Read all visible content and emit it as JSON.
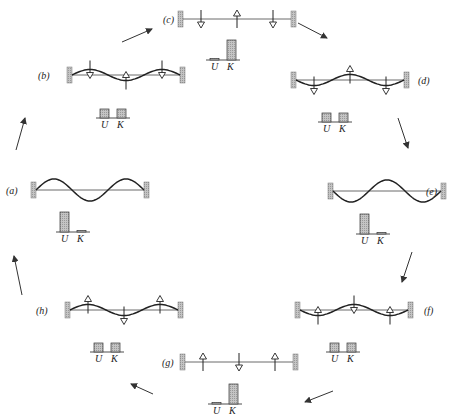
{
  "figure": {
    "colors": {
      "ink": "#222222",
      "wall_fill": "#bdbdbd",
      "bar_fill": "#c8c8c8",
      "arrow": "#333333"
    },
    "panels": [
      {
        "id": "a",
        "label": "(a)",
        "state": "max-displacement",
        "shape": "+1",
        "velocity_arrows": "none",
        "U": "max",
        "K": "zero"
      },
      {
        "id": "b",
        "label": "(b)",
        "state": "partial-displacement",
        "shape": "+0.5",
        "velocity_arrows": "down-up-down",
        "U": "half",
        "K": "half"
      },
      {
        "id": "c",
        "label": "(c)",
        "state": "flat",
        "shape": "0",
        "velocity_arrows": "down-up-down",
        "U": "zero",
        "K": "max"
      },
      {
        "id": "d",
        "label": "(d)",
        "state": "partial-displacement",
        "shape": "-0.5",
        "velocity_arrows": "down-up-down",
        "U": "half",
        "K": "half"
      },
      {
        "id": "e",
        "label": "(e)",
        "state": "max-displacement",
        "shape": "-1",
        "velocity_arrows": "none",
        "U": "max",
        "K": "zero"
      },
      {
        "id": "f",
        "label": "(f)",
        "state": "partial-displacement",
        "shape": "-0.5",
        "velocity_arrows": "up-down-up",
        "U": "half",
        "K": "half"
      },
      {
        "id": "g",
        "label": "(g)",
        "state": "flat",
        "shape": "0",
        "velocity_arrows": "up-down-up",
        "U": "zero",
        "K": "max"
      },
      {
        "id": "h",
        "label": "(h)",
        "state": "partial-displacement",
        "shape": "+0.5",
        "velocity_arrows": "up-down-up",
        "U": "half",
        "K": "half"
      }
    ],
    "bar_labels": {
      "U": "U",
      "K": "K"
    },
    "cycle_arrows": [
      "a→b",
      "b→c",
      "c→d",
      "d→e",
      "e→f",
      "f→g",
      "g→h",
      "h→a"
    ]
  }
}
